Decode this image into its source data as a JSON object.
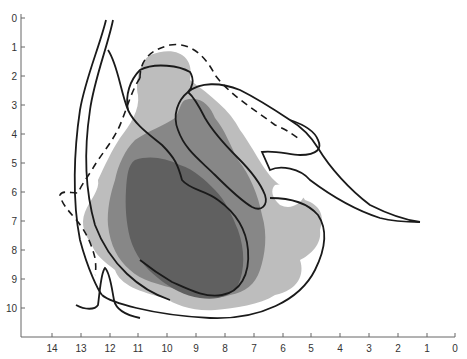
{
  "figure": {
    "type": "anatomical-contour-diagram",
    "y_axis": {
      "ticks": [
        "0",
        "1",
        "2",
        "3",
        "4",
        "5",
        "6",
        "7",
        "8",
        "9",
        "10"
      ]
    },
    "x_axis": {
      "ticks": [
        "14",
        "13",
        "12",
        "11",
        "10",
        "9",
        "8",
        "7",
        "6",
        "5",
        "4",
        "3",
        "2",
        "1",
        "0"
      ]
    },
    "regions": [
      {
        "name": "light-shaded-region",
        "color": "#b9b9b9"
      },
      {
        "name": "medium-shaded-region",
        "color": "#858585"
      },
      {
        "name": "dark-shaded-region",
        "color": "#5e5e5e"
      }
    ],
    "line_color": "#1a1a1a",
    "axis_color": "#666666"
  }
}
